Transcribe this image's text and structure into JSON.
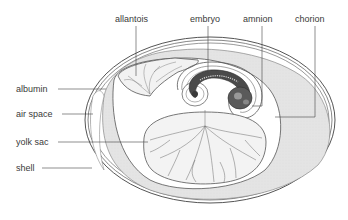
{
  "diagram": {
    "labels": {
      "allantois": "allantois",
      "embryo": "embryo",
      "amnion": "amnion",
      "chorion": "chorion",
      "albumin": "albumin",
      "air_space": "air space",
      "yolk_sac": "yolk sac",
      "shell": "shell"
    },
    "colors": {
      "albumin_fill": "#e6e6e6",
      "outline": "#555555",
      "text": "#3a3a3a",
      "embryo_dark": "#2e2e2e"
    }
  }
}
